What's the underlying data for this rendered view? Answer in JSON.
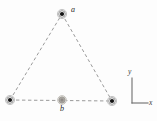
{
  "figure": {
    "background_color": "#fdfdfd",
    "width": 157,
    "height": 121,
    "labels": {
      "vertex_top": "a",
      "midpoint_bottom": "b",
      "axis_y": "y",
      "axis_x": "x"
    },
    "colors": {
      "charge_dark_fill": "#141414",
      "charge_dark_ring": "#8a8a8a",
      "charge_light_fill": "#a9a5a0",
      "charge_light_ring": "#9b9892",
      "dashed_line": "#9a9a9a",
      "axis_line": "#6e6e6e",
      "text": "#262626"
    },
    "points": [
      {
        "name": "charge-a-top",
        "label": "a",
        "x": 62,
        "y": 14,
        "style": "dark",
        "radius": 4.6
      },
      {
        "name": "charge-bottom-left",
        "label": "",
        "x": 10,
        "y": 100,
        "style": "dark",
        "radius": 4.6
      },
      {
        "name": "charge-bottom-right",
        "label": "",
        "x": 112,
        "y": 101,
        "style": "dark",
        "radius": 4.6
      },
      {
        "name": "point-b-midpoint",
        "label": "b",
        "x": 62,
        "y": 100,
        "style": "light",
        "radius": 4.4
      }
    ],
    "edges": [
      {
        "name": "edge-left",
        "x1": 10,
        "y1": 100,
        "x2": 62,
        "y2": 14
      },
      {
        "name": "edge-right",
        "x1": 62,
        "y1": 14,
        "x2": 112,
        "y2": 101
      },
      {
        "name": "edge-bottom",
        "x1": 10,
        "y1": 100,
        "x2": 112,
        "y2": 101
      }
    ],
    "axes": {
      "origin_x": 132,
      "origin_y": 103,
      "y_top": 78,
      "x_right": 148
    }
  }
}
